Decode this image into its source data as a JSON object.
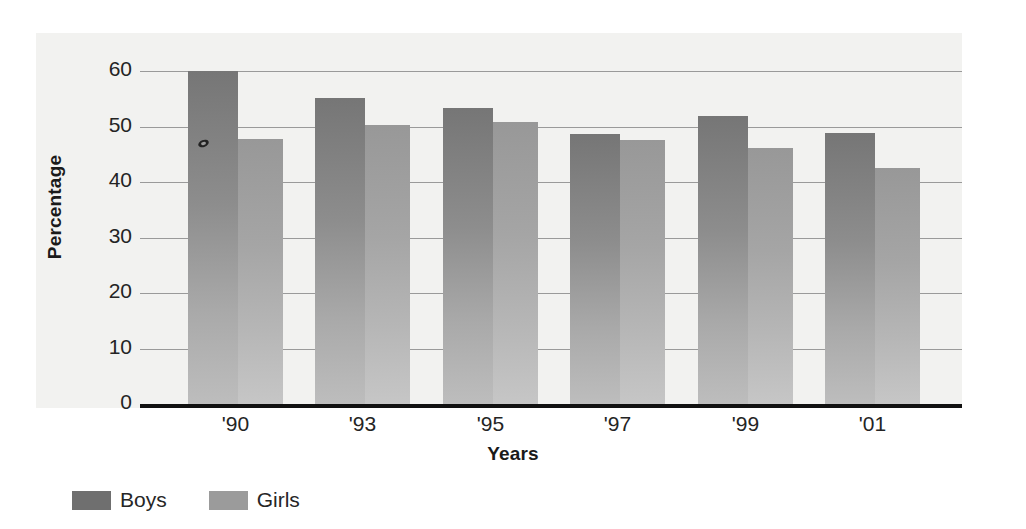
{
  "chart_data": {
    "type": "bar",
    "title": "",
    "xlabel": "Years",
    "ylabel": "Percentage",
    "categories": [
      "'90",
      "'93",
      "'95",
      "'97",
      "'99",
      "'01"
    ],
    "series": [
      {
        "name": "Boys",
        "color": "#6f6f6f",
        "values": [
          60.0,
          55.2,
          53.4,
          48.6,
          51.9,
          48.9
        ]
      },
      {
        "name": "Girls",
        "color": "#9b9b9b",
        "values": [
          47.7,
          50.2,
          50.9,
          47.5,
          46.1,
          42.5
        ]
      }
    ],
    "ylim": [
      0,
      60
    ],
    "yticks": [
      60,
      50,
      40,
      30,
      20,
      10,
      0
    ],
    "ytick_labels": [
      "60",
      "50",
      "40",
      "30",
      "20",
      "10",
      "0"
    ],
    "grid": true,
    "grid_axis": "y",
    "legend_position": "bottom-left",
    "plot_background": "#f2f2f0",
    "gridline_color": "#9a9a9a",
    "axis_color": "#111111"
  },
  "axes": {
    "y_title": "Percentage",
    "x_title": "Years"
  },
  "legend": {
    "entries": [
      {
        "label": "Boys",
        "color": "#6f6f6f"
      },
      {
        "label": "Girls",
        "color": "#9b9b9b"
      }
    ]
  }
}
